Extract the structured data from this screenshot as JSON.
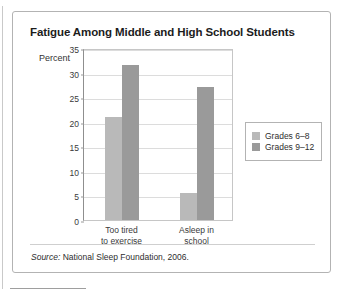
{
  "figure": {
    "title": "Fatigue Among Middle and High School Students",
    "source_prefix": "Source:",
    "source_text": " National Sleep Foundation, 2006."
  },
  "chart_data": {
    "type": "bar",
    "title": "Fatigue Among Middle and High School Students",
    "xlabel": "",
    "ylabel": "Percent",
    "ylim": [
      0,
      35
    ],
    "yticks": [
      0,
      5,
      10,
      15,
      20,
      25,
      30,
      35
    ],
    "ytick_labels": [
      "0",
      "5",
      "10",
      "15",
      "20",
      "25",
      "30",
      "35"
    ],
    "grid": true,
    "legend_position": "right",
    "categories": [
      "Too tired to exercise",
      "Asleep in school"
    ],
    "category_lines": [
      [
        "Too tired",
        "to exercise"
      ],
      [
        "Asleep in",
        "school"
      ]
    ],
    "series": [
      {
        "name": "Grades 6–8",
        "color": "#b9b9b9",
        "values": [
          21,
          5.5
        ]
      },
      {
        "name": "Grades 9–12",
        "color": "#9a9a9a",
        "values": [
          31.5,
          27
        ]
      }
    ]
  },
  "legend": {
    "items": [
      {
        "label": "Grades 6–8",
        "color": "#b9b9b9"
      },
      {
        "label": "Grades 9–12",
        "color": "#9a9a9a"
      }
    ]
  }
}
